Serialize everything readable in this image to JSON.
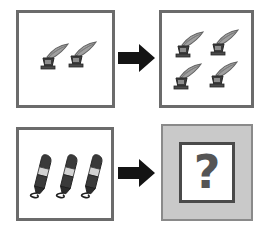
{
  "figure": {
    "background_color": "#ffffff",
    "panel_border_color": "#6b6b6b",
    "answer_plate_color": "#c9c9c9",
    "arrow_color": "#141414",
    "ink_dark_color": "#3a3a3a",
    "feather_color": "#9a9a9a"
  },
  "panels": [
    {
      "id": "top-left",
      "role": "prompt-a",
      "object": "quill-in-inkwell",
      "count": 2,
      "fill": "#ffffff",
      "items": [
        {
          "name": "quill-1"
        },
        {
          "name": "quill-2"
        }
      ]
    },
    {
      "id": "top-right",
      "role": "answer-a",
      "object": "quill-in-inkwell",
      "count": 4,
      "fill": "#ffffff",
      "items": [
        {
          "name": "quill-1"
        },
        {
          "name": "quill-2"
        },
        {
          "name": "quill-3"
        },
        {
          "name": "quill-4"
        }
      ]
    },
    {
      "id": "bottom-left",
      "role": "prompt-b",
      "object": "pen",
      "count": 3,
      "fill": "#ffffff",
      "items": [
        {
          "name": "pen-1"
        },
        {
          "name": "pen-2"
        },
        {
          "name": "pen-3"
        }
      ]
    },
    {
      "id": "bottom-right",
      "role": "answer-b-unknown",
      "object": "question-mark",
      "count": 1,
      "fill": "#c9c9c9",
      "label": "?"
    }
  ],
  "arrows": [
    {
      "id": "arrow-top",
      "direction": "right",
      "color": "#141414"
    },
    {
      "id": "arrow-bottom",
      "direction": "right",
      "color": "#141414"
    }
  ]
}
